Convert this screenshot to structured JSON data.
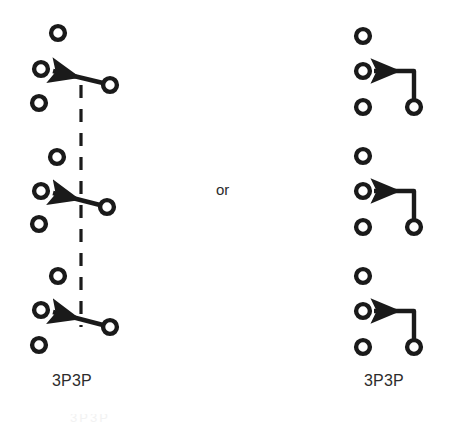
{
  "figure": {
    "background_color": "#ffffff",
    "stroke_color": "#1a1a1a",
    "text_color": "#2b2b2b",
    "width": 451,
    "height": 424
  },
  "connector_label": "or",
  "left_diagram": {
    "label": "3P3P",
    "style": "slanted-pole-with-dashed-ganging-bar",
    "dashed_bar": {
      "x": 81,
      "y_top": 85,
      "y_bottom": 327
    },
    "poles": [
      {
        "terminals": [
          {
            "name": "terminal-top",
            "cx": 58,
            "cy": 33,
            "r": 9
          },
          {
            "name": "terminal-common",
            "cx": 41,
            "cy": 69,
            "r": 9
          },
          {
            "name": "terminal-bottom",
            "cx": 39,
            "cy": 103,
            "r": 9
          },
          {
            "name": "terminal-blade-pivot",
            "cx": 110,
            "cy": 85,
            "r": 9
          }
        ],
        "blade": {
          "x1": 103,
          "y1": 83,
          "x2": 52,
          "y2": 71
        }
      },
      {
        "terminals": [
          {
            "name": "terminal-top",
            "cx": 57,
            "cy": 157,
            "r": 9
          },
          {
            "name": "terminal-common",
            "cx": 41,
            "cy": 191,
            "r": 9
          },
          {
            "name": "terminal-bottom",
            "cx": 39,
            "cy": 224,
            "r": 9
          },
          {
            "name": "terminal-blade-pivot",
            "cx": 107,
            "cy": 207,
            "r": 9
          }
        ],
        "blade": {
          "x1": 100,
          "y1": 205,
          "x2": 52,
          "y2": 193
        }
      },
      {
        "terminals": [
          {
            "name": "terminal-top",
            "cx": 58,
            "cy": 276,
            "r": 9
          },
          {
            "name": "terminal-common",
            "cx": 41,
            "cy": 310,
            "r": 9
          },
          {
            "name": "terminal-bottom",
            "cx": 39,
            "cy": 345,
            "r": 9
          },
          {
            "name": "terminal-blade-pivot",
            "cx": 110,
            "cy": 327,
            "r": 9
          }
        ],
        "blade": {
          "x1": 103,
          "y1": 325,
          "x2": 52,
          "y2": 312
        }
      }
    ]
  },
  "right_diagram": {
    "label": "3P3P",
    "style": "right-angle-pole-connector",
    "poles": [
      {
        "terminals": [
          {
            "name": "terminal-top",
            "cx": 363,
            "cy": 36,
            "r": 9
          },
          {
            "name": "terminal-common",
            "cx": 363,
            "cy": 71,
            "r": 9
          },
          {
            "name": "terminal-bottom",
            "cx": 363,
            "cy": 107,
            "r": 9
          },
          {
            "name": "terminal-blade-pivot",
            "cx": 414,
            "cy": 107,
            "r": 9
          }
        ],
        "connector": {
          "corner_x": 414,
          "corner_y": 69,
          "from_y": 99,
          "to_x": 373
        }
      },
      {
        "terminals": [
          {
            "name": "terminal-top",
            "cx": 363,
            "cy": 156,
            "r": 9
          },
          {
            "name": "terminal-common",
            "cx": 363,
            "cy": 191,
            "r": 9
          },
          {
            "name": "terminal-bottom",
            "cx": 363,
            "cy": 227,
            "r": 9
          },
          {
            "name": "terminal-blade-pivot",
            "cx": 414,
            "cy": 227,
            "r": 9
          }
        ],
        "connector": {
          "corner_x": 414,
          "corner_y": 189,
          "from_y": 219,
          "to_x": 373
        }
      },
      {
        "terminals": [
          {
            "name": "terminal-top",
            "cx": 363,
            "cy": 276,
            "r": 9
          },
          {
            "name": "terminal-common",
            "cx": 363,
            "cy": 311,
            "r": 9
          },
          {
            "name": "terminal-bottom",
            "cx": 363,
            "cy": 347,
            "r": 9
          },
          {
            "name": "terminal-blade-pivot",
            "cx": 414,
            "cy": 347,
            "r": 9
          }
        ],
        "connector": {
          "corner_x": 414,
          "corner_y": 309,
          "from_y": 339,
          "to_x": 373
        }
      }
    ]
  },
  "caption_clipped": "3P3P"
}
